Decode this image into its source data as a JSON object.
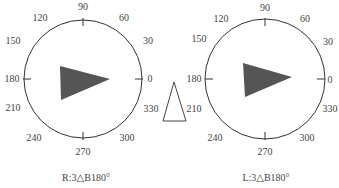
{
  "dials": [
    {
      "id": "right-eye",
      "caption": "R:3△B180°",
      "center": [
        83,
        79
      ],
      "radius": 59,
      "prism_fill": "#555555",
      "prism_points": "60,66 110,79 61,100",
      "labels": [
        "0",
        "30",
        "60",
        "90",
        "120",
        "150",
        "180",
        "210",
        "240",
        "270",
        "300",
        "330"
      ]
    },
    {
      "id": "left-eye",
      "caption": "L:3△B180°",
      "center": [
        265,
        79
      ],
      "radius": 60,
      "prism_fill": "#555555",
      "prism_points": "243,63 292,77 245,97",
      "labels": [
        "0",
        "30",
        "60",
        "90",
        "120",
        "150",
        "180",
        "210",
        "240",
        "270",
        "300",
        "330"
      ]
    }
  ],
  "center_prism_icon": "prism-outline-icon",
  "colors": {
    "line": "#333333",
    "text": "#444444",
    "prism": "#555555"
  }
}
